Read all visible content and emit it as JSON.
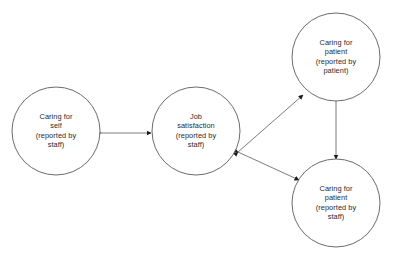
{
  "diagram": {
    "background_color": "#ffffff",
    "node_stroke_color": "#5a5a5a",
    "edge_stroke_color": "#7d7d7d",
    "arrowhead_color": "#1a1a1a",
    "text_color": "#2b2b2b",
    "nodes": [
      {
        "id": "caring-for-self-staff",
        "label": "Caring for\nself\n(reported by\nstaff)",
        "cx": 56,
        "cy": 131,
        "r": 44
      },
      {
        "id": "job-satisfaction-staff",
        "label": "Job\nsatisfaction\n(reported by\nstaff)",
        "cx": 196,
        "cy": 131,
        "r": 44
      },
      {
        "id": "caring-for-patient-patient",
        "label": "Caring for\npatient\n(reported by\npatient)",
        "cx": 336,
        "cy": 57,
        "r": 44
      },
      {
        "id": "caring-for-patient-staff",
        "label": "Caring for\npatient\n(reported by\nstaff)",
        "cx": 336,
        "cy": 203,
        "r": 44
      }
    ],
    "edges": [
      {
        "id": "edge-self-to-jobsatisfaction",
        "from": "caring-for-self-staff",
        "to": "job-satisfaction-staff",
        "direction": "bidirectional",
        "x1": 101,
        "y1": 133,
        "x2": 151,
        "y2": 133
      },
      {
        "id": "edge-jobsatisfaction-to-patientpatient",
        "from": "job-satisfaction-staff",
        "to": "caring-for-patient-patient",
        "direction": "bidirectional",
        "x1": 238,
        "y1": 152,
        "x2": 303,
        "y2": 95
      },
      {
        "id": "edge-jobsatisfaction-to-patientstaff",
        "from": "job-satisfaction-staff",
        "to": "caring-for-patient-staff",
        "direction": "bidirectional",
        "x1": 238,
        "y1": 152,
        "x2": 299,
        "y2": 180
      },
      {
        "id": "edge-patientpatient-to-patientstaff",
        "from": "caring-for-patient-patient",
        "to": "caring-for-patient-staff",
        "direction": "bidirectional",
        "x1": 336,
        "y1": 101,
        "x2": 336,
        "y2": 159
      }
    ]
  }
}
